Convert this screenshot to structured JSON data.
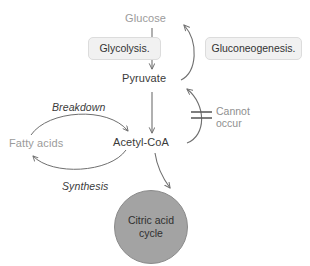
{
  "diagram": {
    "background_color": "#ffffff",
    "stroke_color": "#6f6f6f",
    "nodes": {
      "glucose": {
        "label": "Glucose",
        "color": "#9b9b9b"
      },
      "pyruvate": {
        "label": "Pyruvate",
        "color": "#3a3a3a"
      },
      "acetyl_coa": {
        "label": "Acetyl-CoA",
        "color": "#3a3a3a"
      },
      "fatty_acids": {
        "label": "Fatty acids",
        "color": "#9b9b9b"
      },
      "citric_acid_cycle": {
        "line1": "Citric acid",
        "line2": "cycle",
        "fill_color": "#a3a3a3",
        "text_color": "#2f2f2f"
      }
    },
    "boxes": {
      "glycolysis": {
        "label": "Glycolysis.",
        "fill_color": "#f1f1f1",
        "border_color": "#dcdcdc"
      },
      "gluconeogenesis": {
        "label": "Gluconeogenesis.",
        "fill_color": "#f1f1f1",
        "border_color": "#dcdcdc"
      }
    },
    "annotations": {
      "breakdown": {
        "label": "Breakdown",
        "style": "italic"
      },
      "synthesis": {
        "label": "Synthesis",
        "style": "italic"
      },
      "blocked": {
        "line1": "Cannot",
        "line2": "occur",
        "color": "#8f8f8f"
      }
    },
    "edges": [
      {
        "name": "glucose-to-pyruvate",
        "from": "Glucose",
        "to": "Pyruvate",
        "shape": "straight-down"
      },
      {
        "name": "pyruvate-to-glucose",
        "from": "Pyruvate",
        "to": "Glucose",
        "shape": "curve-right-up"
      },
      {
        "name": "pyruvate-to-acetyl-coa",
        "from": "Pyruvate",
        "to": "Acetyl-CoA",
        "shape": "straight-down"
      },
      {
        "name": "acetyl-coa-to-pyruvate-blocked",
        "from": "Acetyl-CoA",
        "to": "Pyruvate",
        "shape": "curve-right-up",
        "blocked": true
      },
      {
        "name": "fatty-acids-to-acetyl-coa",
        "from": "Fatty acids",
        "to": "Acetyl-CoA",
        "shape": "arc-over",
        "label": "Breakdown"
      },
      {
        "name": "acetyl-coa-to-fatty-acids",
        "from": "Acetyl-CoA",
        "to": "Fatty acids",
        "shape": "arc-under",
        "label": "Synthesis"
      },
      {
        "name": "acetyl-coa-to-citric-acid-cycle",
        "from": "Acetyl-CoA",
        "to": "Citric acid cycle",
        "shape": "curve-down"
      }
    ]
  }
}
